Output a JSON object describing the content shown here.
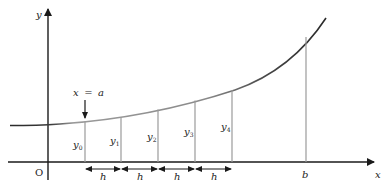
{
  "diagram": {
    "axes": {
      "x_label": "x",
      "y_label": "y",
      "origin_label": "O"
    },
    "annotations": {
      "start_label_var": "x",
      "start_label_eq": "=",
      "start_label_val": "a",
      "end_label": "b"
    },
    "ordinates": [
      {
        "base": "y",
        "sub": "0"
      },
      {
        "base": "y",
        "sub": "1"
      },
      {
        "base": "y",
        "sub": "2"
      },
      {
        "base": "y",
        "sub": "3"
      },
      {
        "base": "y",
        "sub": "4"
      }
    ],
    "strip_width_labels": [
      "h",
      "h",
      "h",
      "h"
    ],
    "colors": {
      "axis": "#1a1a1a",
      "curve_left": "#2a2a2a",
      "curve_mid": "#8a8a8a",
      "curve_right": "#2a2a2a",
      "ordinate": "#9a9a9a"
    }
  }
}
